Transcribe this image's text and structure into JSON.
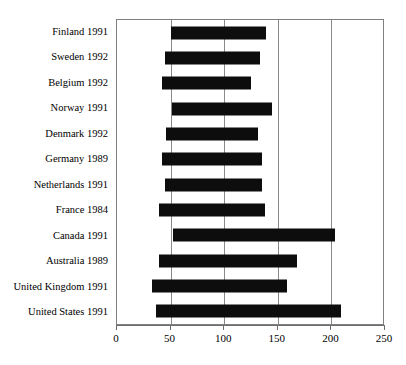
{
  "chart_data": {
    "type": "bar",
    "orientation": "horizontal",
    "bar_style": "floating-range",
    "title": "",
    "xlabel": "",
    "ylabel": "",
    "xlim": [
      0,
      250
    ],
    "xticks": [
      0,
      50,
      100,
      150,
      200,
      250
    ],
    "xtick_labels": [
      "0",
      "50",
      "100",
      "150",
      "200",
      "250"
    ],
    "grid": "vertical",
    "legend": "none",
    "bar_color": "#0d0d0d",
    "categories": [
      "Finland 1991",
      "Sweden 1992",
      "Belgium 1992",
      "Norway 1991",
      "Denmark 1992",
      "Germany 1989",
      "Netherlands 1991",
      "France 1984",
      "Canada 1991",
      "Australia 1989",
      "United Kingdom 1991",
      "United States 1991"
    ],
    "bars": [
      {
        "category": "Finland 1991",
        "start": 50,
        "end": 139,
        "length": 89
      },
      {
        "category": "Sweden 1992",
        "start": 45,
        "end": 133,
        "length": 88
      },
      {
        "category": "Belgium 1992",
        "start": 42,
        "end": 125,
        "length": 83
      },
      {
        "category": "Norway 1991",
        "start": 51,
        "end": 145,
        "length": 94
      },
      {
        "category": "Denmark 1992",
        "start": 46,
        "end": 132,
        "length": 86
      },
      {
        "category": "Germany 1989",
        "start": 42,
        "end": 135,
        "length": 93
      },
      {
        "category": "Netherlands 1991",
        "start": 45,
        "end": 135,
        "length": 90
      },
      {
        "category": "France 1984",
        "start": 39,
        "end": 138,
        "length": 99
      },
      {
        "category": "Canada 1991",
        "start": 52,
        "end": 203,
        "length": 151
      },
      {
        "category": "Australia 1989",
        "start": 39,
        "end": 168,
        "length": 129
      },
      {
        "category": "United Kingdom 1991",
        "start": 33,
        "end": 159,
        "length": 126
      },
      {
        "category": "United States 1991",
        "start": 36,
        "end": 209,
        "length": 173
      }
    ]
  }
}
